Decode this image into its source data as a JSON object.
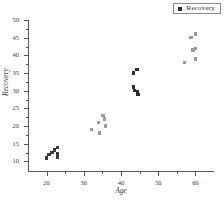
{
  "legend": {
    "entries": [
      {
        "label": "Recovery",
        "marker": "filled-square",
        "color": "#2e2e2e"
      }
    ]
  },
  "axes": {
    "x_title": "Age",
    "y_title": "Recovery"
  },
  "chart_data": {
    "type": "scatter",
    "title": "",
    "xlabel": "Age",
    "ylabel": "Recovery",
    "xlim": [
      15,
      65
    ],
    "ylim": [
      7,
      50
    ],
    "xticks": [
      20,
      30,
      40,
      50,
      60
    ],
    "xtick_labels": [
      "20",
      "30",
      "40",
      "50",
      "60"
    ],
    "x_minor_ticks": [
      25,
      35,
      45,
      55
    ],
    "yticks": [
      10,
      15,
      20,
      25,
      30,
      35,
      40,
      45,
      50
    ],
    "ytick_labels": [
      "10",
      "15",
      "20",
      "25",
      "30",
      "35",
      "40",
      "45",
      "50"
    ],
    "y_minor_ticks": [
      12.5,
      17.5,
      22.5,
      27.5,
      32.5,
      37.5,
      42.5,
      47.5
    ],
    "grid": false,
    "legend_position": "top-right",
    "series": [
      {
        "name": "Recovery",
        "marker": "square",
        "points": [
          {
            "x": 20.0,
            "y": 11.0,
            "color": "#3a3a3a"
          },
          {
            "x": 20.6,
            "y": 12.0,
            "color": "#3a3a3a"
          },
          {
            "x": 21.4,
            "y": 12.6,
            "color": "#3a3a3a"
          },
          {
            "x": 22.2,
            "y": 13.2,
            "color": "#3a3a3a"
          },
          {
            "x": 23.0,
            "y": 14.0,
            "color": "#3a3a3a"
          },
          {
            "x": 22.9,
            "y": 12.3,
            "color": "#3a3a3a"
          },
          {
            "x": 22.9,
            "y": 11.6,
            "color": "#3a3a3a"
          },
          {
            "x": 22.9,
            "y": 11.1,
            "color": "#3a3a3a"
          },
          {
            "x": 32.0,
            "y": 19.0,
            "color": "#9a9a9a"
          },
          {
            "x": 34.0,
            "y": 21.0,
            "color": "#9a9a9a"
          },
          {
            "x": 34.2,
            "y": 18.0,
            "color": "#9a9a9a"
          },
          {
            "x": 35.2,
            "y": 23.0,
            "color": "#9a9a9a"
          },
          {
            "x": 35.6,
            "y": 22.0,
            "color": "#9a9a9a"
          },
          {
            "x": 35.8,
            "y": 20.0,
            "color": "#9a9a9a"
          },
          {
            "x": 43.4,
            "y": 35.0,
            "color": "#2e2e2e"
          },
          {
            "x": 44.3,
            "y": 36.0,
            "color": "#2e2e2e"
          },
          {
            "x": 43.3,
            "y": 31.0,
            "color": "#2e2e2e"
          },
          {
            "x": 43.7,
            "y": 30.0,
            "color": "#2e2e2e"
          },
          {
            "x": 44.4,
            "y": 29.6,
            "color": "#2e2e2e"
          },
          {
            "x": 44.6,
            "y": 29.0,
            "color": "#2e2e2e"
          },
          {
            "x": 57.0,
            "y": 38.0,
            "color": "#9a9a9a"
          },
          {
            "x": 58.8,
            "y": 45.0,
            "color": "#9a9a9a"
          },
          {
            "x": 60.0,
            "y": 46.0,
            "color": "#9a9a9a"
          },
          {
            "x": 59.4,
            "y": 41.5,
            "color": "#9a9a9a"
          },
          {
            "x": 60.0,
            "y": 42.0,
            "color": "#9a9a9a"
          },
          {
            "x": 60.0,
            "y": 39.0,
            "color": "#9a9a9a"
          }
        ]
      }
    ]
  }
}
